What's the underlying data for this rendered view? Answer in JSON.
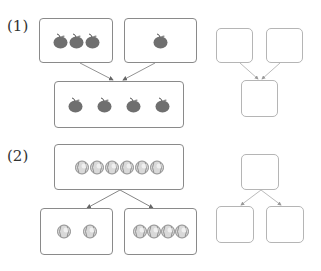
{
  "problems": [
    {
      "label": "(1)",
      "type": "combine",
      "parts": [
        {
          "item": "apple-icon",
          "count": 3
        },
        {
          "item": "apple-icon",
          "count": 1
        }
      ],
      "whole": {
        "item": "apple-icon",
        "count": 4
      },
      "answer_boxes": [
        "",
        "",
        ""
      ]
    },
    {
      "label": "(2)",
      "type": "split",
      "whole": {
        "item": "baseball-icon",
        "count": 6
      },
      "parts": [
        {
          "item": "baseball-icon",
          "count": 2
        },
        {
          "item": "baseball-icon",
          "count": 4
        }
      ],
      "answer_boxes": [
        "",
        "",
        ""
      ]
    }
  ],
  "colors": {
    "apple": "#6f6f6f",
    "baseball": "#d9d9d9",
    "border": "#8a8a8a",
    "answer_border": "#b5b5b5",
    "arrow": "#666666"
  }
}
